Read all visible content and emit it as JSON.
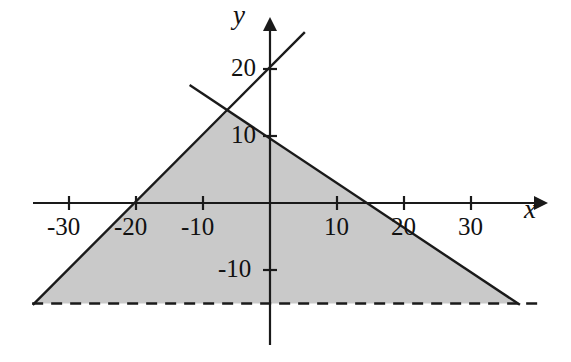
{
  "figure": {
    "title": "",
    "background_color": "#ffffff",
    "line_color": "#1a1a1a",
    "fill_color": "#c9c9c9",
    "axis_labels": {
      "x": "x",
      "y": "y"
    }
  },
  "axes": {
    "x_ticks": [
      {
        "value": -30,
        "label": "-30"
      },
      {
        "value": -20,
        "label": "-20"
      },
      {
        "value": -10,
        "label": "-10"
      },
      {
        "value": 10,
        "label": "10"
      },
      {
        "value": 20,
        "label": "20"
      },
      {
        "value": 30,
        "label": "30"
      }
    ],
    "y_ticks": [
      {
        "value": 20,
        "label": "20"
      },
      {
        "value": 10,
        "label": "10"
      },
      {
        "value": -10,
        "label": "-10"
      }
    ]
  },
  "chart_data": {
    "type": "line",
    "title": "",
    "xlabel": "x",
    "ylabel": "y",
    "xlim": [
      -35.5,
      40
    ],
    "ylim": [
      -20,
      21
    ],
    "grid": false,
    "legend": "none",
    "origin_px": [
      270,
      203
    ],
    "px_per_unit": 6.7,
    "series": [
      {
        "name": "ascending-line",
        "style": "solid",
        "slope": 1.0,
        "intercept": 20,
        "x_intercept": -20,
        "points": [
          [
            -35.4,
            -15.2
          ],
          [
            5.2,
            25.5
          ]
        ]
      },
      {
        "name": "descending-line",
        "style": "solid",
        "slope": -0.625,
        "intercept": 10,
        "x_intercept": 16,
        "points": [
          [
            -12.0,
            17.6
          ],
          [
            37.3,
            -15.2
          ]
        ]
      },
      {
        "name": "horizontal-dashed-line",
        "style": "dashed",
        "slope": 0,
        "intercept": -15,
        "points": [
          [
            -35.5,
            -15
          ],
          [
            40.0,
            -15
          ]
        ]
      }
    ],
    "shaded_region": {
      "name": "feasible-triangle",
      "fill": "#c9c9c9",
      "vertices": [
        [
          -6.3,
          13.7
        ],
        [
          37.3,
          -15.0
        ],
        [
          -35.4,
          -15.0
        ]
      ]
    },
    "intersections": [
      {
        "label": "lines-cross",
        "x": -6.3,
        "y": 13.7
      }
    ]
  }
}
